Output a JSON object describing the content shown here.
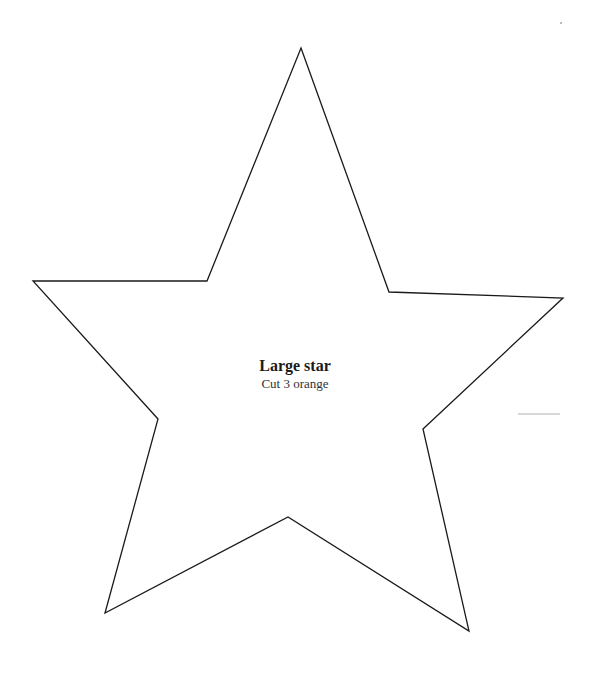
{
  "template": {
    "shape": "star",
    "title": "Large star",
    "instruction": "Cut 3 orange",
    "stroke_color": "#1a1a1a",
    "background_color": "#ffffff",
    "points": "301,48 389,292 563,298 423,429 469,631 288,517 105,613 158,419 33,281 207,281"
  }
}
